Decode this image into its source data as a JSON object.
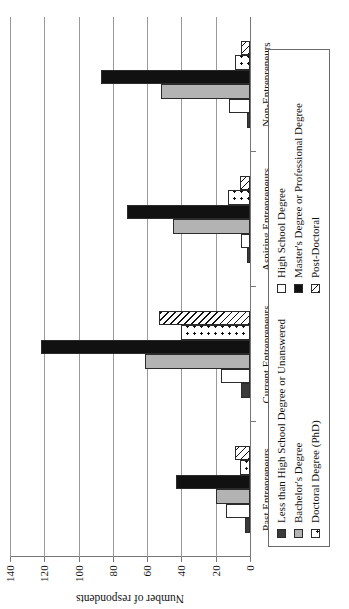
{
  "chart_data": {
    "type": "bar",
    "title": "",
    "xlabel": "",
    "ylabel": "Number of respondents",
    "ylim": [
      0,
      140
    ],
    "yticks": [
      0,
      20,
      40,
      60,
      80,
      100,
      120,
      140
    ],
    "grid": true,
    "orientation": "rotated-90-ccw",
    "legend_position": "below-plot",
    "categories": [
      "Past Entrepreneurs",
      "Current Entrepreneurs",
      "Aspiring Entrepreneurs",
      "Non-Entrepreneurs"
    ],
    "series": [
      {
        "name": "Less than High School Degree or Unanswered",
        "pattern": "solid-dark",
        "color": "#3a3a3a",
        "values": [
          3,
          5,
          2,
          2
        ]
      },
      {
        "name": "High School Degree",
        "pattern": "empty-white",
        "color": "#ffffff",
        "values": [
          14,
          17,
          5,
          12
        ]
      },
      {
        "name": "Bachelor's Degree",
        "pattern": "solid-grey",
        "color": "#b3b3b3",
        "values": [
          20,
          61,
          45,
          52
        ]
      },
      {
        "name": "Master's Degree or Professional Degree",
        "pattern": "solid-black",
        "color": "#111111",
        "values": [
          43,
          122,
          72,
          87
        ]
      },
      {
        "name": "Doctoral Degree (PhD)",
        "pattern": "dotted",
        "color": "#ffffff",
        "values": [
          6,
          40,
          13,
          9
        ]
      },
      {
        "name": "Post-Doctoral",
        "pattern": "diagonal-hatch",
        "color": "#ffffff",
        "values": [
          9,
          53,
          6,
          5
        ]
      }
    ]
  },
  "axis": {
    "ylabel": "Number of respondents",
    "tick_labels": [
      "0",
      "20",
      "40",
      "60",
      "80",
      "100",
      "120",
      "140"
    ]
  },
  "legend": {
    "items": [
      {
        "label": "Less than High School Degree or Unanswered",
        "swatch": "solid-dark"
      },
      {
        "label": "Bachelor's Degree",
        "swatch": "solid-grey"
      },
      {
        "label": "Doctoral Degree (PhD)",
        "swatch": "dotted"
      },
      {
        "label": "High School Degree",
        "swatch": "empty-white"
      },
      {
        "label": "Master's Degree or Professional Degree",
        "swatch": "solid-black"
      },
      {
        "label": "Post-Doctoral",
        "swatch": "diagonal-hatch"
      }
    ]
  }
}
